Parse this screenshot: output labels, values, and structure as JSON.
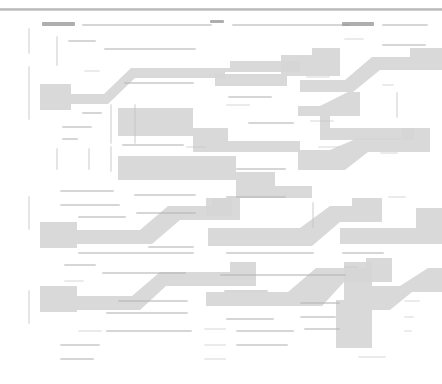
{
  "document": {
    "title": "Zoomed-out document overview",
    "description": "Heavily downscaled page view: body text is rendered below legibility threshold and appears as faint gray line fragments; large light-gray staircase-shaped regions mark highlighted / selected blocks.",
    "page_background": "#ffffff",
    "text_color": "#b6b6b6",
    "highlight_color": "#d6d6d6",
    "rule_color": "#c0c0c0",
    "legibility": "illegible",
    "zoom_level": "fit-page"
  },
  "header": {
    "separator_label": "horizontal-rule",
    "separator_y": 8
  },
  "highlights": {
    "label": "selection-highlight-blocks",
    "count": 18,
    "color": "#d6d6d6",
    "shapes": [
      {
        "name": "highlight-block-1",
        "points": "40,84 71,84 71,110 40,110"
      },
      {
        "name": "highlight-block-2",
        "points": "71,94 104,94 131,68 230,68 230,61 300,61 300,72 225,72 225,78 135,78 108,104 71,104"
      },
      {
        "name": "highlight-block-3",
        "points": "215,74 281,74 281,55 312,55 312,48 340,48 340,76 287,76 287,86 215,86"
      },
      {
        "name": "highlight-block-4",
        "points": "300,80 345,80 372,57 410,57 410,48 442,48 442,70 380,70 353,92 300,92"
      },
      {
        "name": "highlight-block-5",
        "points": "118,108 193,108 193,128 228,128 228,141 300,141 300,152 222,152 193,152 193,136 118,136"
      },
      {
        "name": "highlight-block-6",
        "points": "298,106 320,106 348,92 360,92 360,116 330,116 330,128 414,128 414,140 320,140 320,116 298,116"
      },
      {
        "name": "highlight-block-7",
        "points": "118,156 236,156 236,172 275,172 275,186 312,186 312,198 265,198 236,198 236,180 118,180"
      },
      {
        "name": "highlight-block-8",
        "points": "298,150 330,150 358,138 402,138 402,128 430,128 430,152 368,152 345,170 298,170"
      },
      {
        "name": "highlight-block-9",
        "points": "206,198 232,198 232,216 206,216"
      },
      {
        "name": "highlight-block-10",
        "points": "40,222 77,222 77,248 40,248"
      },
      {
        "name": "highlight-block-11",
        "points": "77,230 140,230 168,206 212,206 212,198 240,198 240,220 222,220 180,220 152,244 77,244"
      },
      {
        "name": "highlight-block-12",
        "points": "208,228 300,228 330,206 352,206 352,198 382,198 382,222 362,222 340,222 312,246 208,246"
      },
      {
        "name": "highlight-block-13",
        "points": "340,228 416,228 416,208 442,208 442,244 362,244 340,244"
      },
      {
        "name": "highlight-block-14",
        "points": "40,286 77,286 77,312 40,312"
      },
      {
        "name": "highlight-block-15",
        "points": "77,296 132,296 160,272 230,272 230,262 256,262 256,286 226,286 166,286 140,310 77,310"
      },
      {
        "name": "highlight-block-16",
        "points": "206,292 288,292 316,268 366,268 366,258 392,258 392,282 344,282 322,306 206,306"
      },
      {
        "name": "highlight-block-17",
        "points": "344,262 372,262 372,348 336,348 336,300 344,300"
      },
      {
        "name": "highlight-block-18",
        "points": "372,286 400,286 428,268 442,268 442,292 412,292 390,310 372,310"
      }
    ]
  },
  "text_lines": {
    "label": "illegible-text-fragments",
    "note": "Each fragment is a blurred gray bar standing in for a line of unreadable body text.",
    "items": [
      {
        "x": 42,
        "y": 22,
        "w": 33,
        "tone": "chip"
      },
      {
        "x": 82,
        "y": 24,
        "w": 130,
        "tone": "normal"
      },
      {
        "x": 210,
        "y": 20,
        "w": 14,
        "tone": "dark"
      },
      {
        "x": 232,
        "y": 24,
        "w": 118,
        "tone": "normal"
      },
      {
        "x": 342,
        "y": 22,
        "w": 32,
        "tone": "chip"
      },
      {
        "x": 382,
        "y": 24,
        "w": 46,
        "tone": "normal"
      },
      {
        "x": 68,
        "y": 40,
        "w": 28,
        "tone": "normal"
      },
      {
        "x": 104,
        "y": 48,
        "w": 92,
        "tone": "normal"
      },
      {
        "x": 344,
        "y": 38,
        "w": 20,
        "tone": "faint"
      },
      {
        "x": 382,
        "y": 44,
        "w": 44,
        "tone": "normal"
      },
      {
        "x": 84,
        "y": 70,
        "w": 16,
        "tone": "faint"
      },
      {
        "x": 124,
        "y": 82,
        "w": 70,
        "tone": "normal"
      },
      {
        "x": 228,
        "y": 96,
        "w": 44,
        "tone": "normal"
      },
      {
        "x": 306,
        "y": 76,
        "w": 24,
        "tone": "faint"
      },
      {
        "x": 382,
        "y": 84,
        "w": 12,
        "tone": "faint"
      },
      {
        "x": 82,
        "y": 112,
        "w": 20,
        "tone": "normal"
      },
      {
        "x": 62,
        "y": 126,
        "w": 30,
        "tone": "normal"
      },
      {
        "x": 62,
        "y": 138,
        "w": 16,
        "tone": "normal"
      },
      {
        "x": 226,
        "y": 104,
        "w": 24,
        "tone": "faint"
      },
      {
        "x": 248,
        "y": 122,
        "w": 46,
        "tone": "normal"
      },
      {
        "x": 310,
        "y": 120,
        "w": 24,
        "tone": "faint"
      },
      {
        "x": 122,
        "y": 144,
        "w": 62,
        "tone": "normal"
      },
      {
        "x": 186,
        "y": 146,
        "w": 20,
        "tone": "faint"
      },
      {
        "x": 236,
        "y": 168,
        "w": 50,
        "tone": "normal"
      },
      {
        "x": 318,
        "y": 146,
        "w": 22,
        "tone": "faint"
      },
      {
        "x": 380,
        "y": 152,
        "w": 18,
        "tone": "faint"
      },
      {
        "x": 60,
        "y": 190,
        "w": 54,
        "tone": "normal"
      },
      {
        "x": 134,
        "y": 194,
        "w": 62,
        "tone": "normal"
      },
      {
        "x": 226,
        "y": 196,
        "w": 60,
        "tone": "normal"
      },
      {
        "x": 388,
        "y": 196,
        "w": 18,
        "tone": "faint"
      },
      {
        "x": 60,
        "y": 204,
        "w": 60,
        "tone": "normal"
      },
      {
        "x": 136,
        "y": 212,
        "w": 60,
        "tone": "normal"
      },
      {
        "x": 78,
        "y": 216,
        "w": 48,
        "tone": "normal"
      },
      {
        "x": 148,
        "y": 246,
        "w": 46,
        "tone": "normal"
      },
      {
        "x": 78,
        "y": 252,
        "w": 116,
        "tone": "normal"
      },
      {
        "x": 226,
        "y": 252,
        "w": 88,
        "tone": "normal"
      },
      {
        "x": 342,
        "y": 252,
        "w": 42,
        "tone": "normal"
      },
      {
        "x": 64,
        "y": 264,
        "w": 32,
        "tone": "normal"
      },
      {
        "x": 344,
        "y": 266,
        "w": 14,
        "tone": "faint"
      },
      {
        "x": 102,
        "y": 272,
        "w": 84,
        "tone": "normal"
      },
      {
        "x": 220,
        "y": 274,
        "w": 126,
        "tone": "normal"
      },
      {
        "x": 64,
        "y": 280,
        "w": 20,
        "tone": "faint"
      },
      {
        "x": 118,
        "y": 300,
        "w": 70,
        "tone": "normal"
      },
      {
        "x": 224,
        "y": 290,
        "w": 44,
        "tone": "normal"
      },
      {
        "x": 300,
        "y": 302,
        "w": 40,
        "tone": "normal"
      },
      {
        "x": 404,
        "y": 300,
        "w": 16,
        "tone": "faint"
      },
      {
        "x": 106,
        "y": 312,
        "w": 82,
        "tone": "normal"
      },
      {
        "x": 226,
        "y": 318,
        "w": 48,
        "tone": "normal"
      },
      {
        "x": 300,
        "y": 316,
        "w": 36,
        "tone": "normal"
      },
      {
        "x": 404,
        "y": 316,
        "w": 10,
        "tone": "faint"
      },
      {
        "x": 78,
        "y": 330,
        "w": 24,
        "tone": "faint"
      },
      {
        "x": 106,
        "y": 330,
        "w": 86,
        "tone": "normal"
      },
      {
        "x": 204,
        "y": 328,
        "w": 22,
        "tone": "faint"
      },
      {
        "x": 236,
        "y": 330,
        "w": 58,
        "tone": "normal"
      },
      {
        "x": 304,
        "y": 328,
        "w": 36,
        "tone": "normal"
      },
      {
        "x": 404,
        "y": 330,
        "w": 8,
        "tone": "faint"
      },
      {
        "x": 60,
        "y": 344,
        "w": 40,
        "tone": "normal"
      },
      {
        "x": 204,
        "y": 344,
        "w": 22,
        "tone": "faint"
      },
      {
        "x": 236,
        "y": 344,
        "w": 52,
        "tone": "normal"
      },
      {
        "x": 60,
        "y": 358,
        "w": 34,
        "tone": "normal"
      },
      {
        "x": 204,
        "y": 358,
        "w": 22,
        "tone": "faint"
      },
      {
        "x": 358,
        "y": 356,
        "w": 28,
        "tone": "faint"
      }
    ]
  },
  "margin_marks": {
    "label": "margin-change-bars",
    "items": [
      {
        "x": 28,
        "y": 28,
        "h": 26
      },
      {
        "x": 28,
        "y": 66,
        "h": 54
      },
      {
        "x": 28,
        "y": 196,
        "h": 34
      },
      {
        "x": 28,
        "y": 290,
        "h": 34
      },
      {
        "x": 56,
        "y": 36,
        "h": 30
      },
      {
        "x": 56,
        "y": 148,
        "h": 22
      },
      {
        "x": 88,
        "y": 148,
        "h": 22
      },
      {
        "x": 110,
        "y": 146,
        "h": 26
      },
      {
        "x": 110,
        "y": 104,
        "h": 40
      },
      {
        "x": 134,
        "y": 104,
        "h": 40
      },
      {
        "x": 312,
        "y": 202,
        "h": 26
      },
      {
        "x": 396,
        "y": 92,
        "h": 26
      }
    ]
  }
}
